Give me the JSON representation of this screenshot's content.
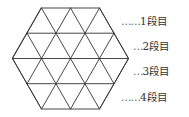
{
  "diagram": {
    "shape": "hexagon divided into equilateral triangles",
    "rows": 4,
    "stroke_color": "#333333",
    "labels": [
      {
        "dots": "……",
        "text": "1段目"
      },
      {
        "dots": "…",
        "text": "2段目"
      },
      {
        "dots": "…",
        "text": "3段目"
      },
      {
        "dots": "……",
        "text": "4段目"
      }
    ]
  }
}
